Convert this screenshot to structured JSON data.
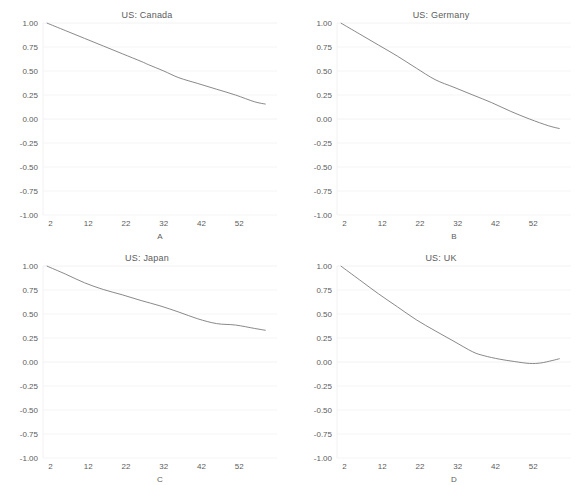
{
  "figure": {
    "width": 588,
    "height": 485,
    "background": "#ffffff",
    "line_color": "#6b6b6b",
    "grid_color": "#f0f0f0",
    "text_color": "#5c5c5c"
  },
  "chart_data": [
    {
      "type": "line",
      "title": "US: Canada",
      "xlabel": "A",
      "ylabel": "",
      "xlim": [
        0,
        62
      ],
      "ylim": [
        -1.0,
        1.0
      ],
      "xticks": [
        2,
        12,
        22,
        32,
        42,
        52
      ],
      "yticks": [
        1.0,
        0.75,
        0.5,
        0.25,
        0.0,
        -0.25,
        -0.5,
        -0.75,
        -1.0
      ],
      "ytick_labels": [
        "1.00",
        "0.75",
        "0.50",
        "0.25",
        "0.00",
        "-0.25",
        "-0.50",
        "-0.75",
        "-1.00"
      ],
      "grid": true,
      "legend": "none",
      "x": [
        1,
        6,
        11,
        16,
        21,
        26,
        28,
        32,
        36,
        41,
        46,
        51,
        56,
        59
      ],
      "y": [
        1.0,
        0.92,
        0.84,
        0.76,
        0.68,
        0.6,
        0.565,
        0.5,
        0.43,
        0.37,
        0.31,
        0.25,
        0.18,
        0.155
      ]
    },
    {
      "type": "line",
      "title": "US: Germany",
      "xlabel": "B",
      "ylabel": "",
      "xlim": [
        0,
        62
      ],
      "ylim": [
        -1.0,
        1.0
      ],
      "xticks": [
        2,
        12,
        22,
        32,
        42,
        52
      ],
      "yticks": [
        1.0,
        0.75,
        0.5,
        0.25,
        0.0,
        -0.25,
        -0.5,
        -0.75,
        -1.0
      ],
      "ytick_labels": [
        "1.00",
        "0.75",
        "0.50",
        "0.25",
        "0.00",
        "-0.25",
        "-0.50",
        "-0.75",
        "-1.00"
      ],
      "grid": true,
      "legend": "none",
      "x": [
        1,
        6,
        11,
        16,
        21,
        26,
        31,
        36,
        41,
        46,
        51,
        56,
        59
      ],
      "y": [
        1.0,
        0.885,
        0.77,
        0.655,
        0.53,
        0.41,
        0.33,
        0.25,
        0.17,
        0.08,
        0.0,
        -0.07,
        -0.1
      ]
    },
    {
      "type": "line",
      "title": "US: Japan",
      "xlabel": "C",
      "ylabel": "",
      "xlim": [
        0,
        62
      ],
      "ylim": [
        -1.0,
        1.0
      ],
      "xticks": [
        2,
        12,
        22,
        32,
        42,
        52
      ],
      "yticks": [
        1.0,
        0.75,
        0.5,
        0.25,
        0.0,
        -0.25,
        -0.5,
        -0.75,
        -1.0
      ],
      "ytick_labels": [
        "1.00",
        "0.75",
        "0.50",
        "0.25",
        "0.00",
        "-0.25",
        "-0.50",
        "-0.75",
        "-1.00"
      ],
      "grid": true,
      "legend": "none",
      "x": [
        1,
        6,
        11,
        16,
        21,
        26,
        31,
        36,
        41,
        46,
        51,
        56,
        59
      ],
      "y": [
        1.0,
        0.915,
        0.825,
        0.755,
        0.7,
        0.64,
        0.585,
        0.52,
        0.45,
        0.4,
        0.385,
        0.35,
        0.33
      ]
    },
    {
      "type": "line",
      "title": "US: UK",
      "xlabel": "D",
      "ylabel": "",
      "xlim": [
        0,
        62
      ],
      "ylim": [
        -1.0,
        1.0
      ],
      "xticks": [
        2,
        12,
        22,
        32,
        42,
        52
      ],
      "yticks": [
        1.0,
        0.75,
        0.5,
        0.25,
        0.0,
        -0.25,
        -0.5,
        -0.75,
        -1.0
      ],
      "ytick_labels": [
        "1.00",
        "0.75",
        "0.50",
        "0.25",
        "0.00",
        "-0.25",
        "-0.50",
        "-0.75",
        "-1.00"
      ],
      "grid": true,
      "legend": "none",
      "x": [
        1,
        6,
        11,
        16,
        21,
        26,
        31,
        36,
        39,
        43,
        47,
        51,
        54,
        57,
        59
      ],
      "y": [
        1.0,
        0.855,
        0.71,
        0.575,
        0.44,
        0.325,
        0.215,
        0.105,
        0.065,
        0.03,
        0.005,
        -0.015,
        -0.01,
        0.015,
        0.035
      ]
    }
  ]
}
